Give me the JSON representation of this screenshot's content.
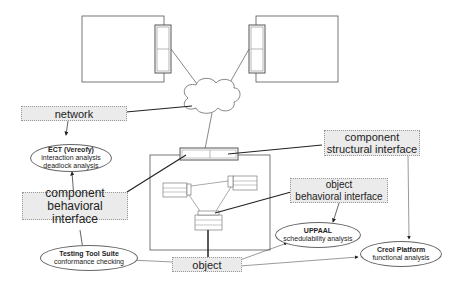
{
  "labels": {
    "network": "network",
    "component_structural": [
      "component",
      "structural interface"
    ],
    "component_behavioral": [
      "component",
      "behavioral interface"
    ],
    "object_behavioral": [
      "object",
      "behavioral interface"
    ],
    "object": "object"
  },
  "tools": {
    "ect": {
      "title": "ECT (Vereofy)",
      "line1": "interaction analysis",
      "line2": "deadlock analysis"
    },
    "testing": {
      "title": "Testing Tool Suite",
      "line1": "conformance checking"
    },
    "uppaal": {
      "title": "UPPAAL",
      "line1": "schedulability analysis"
    },
    "creol": {
      "title": "Creol Platform",
      "line1": "functional analysis"
    }
  }
}
